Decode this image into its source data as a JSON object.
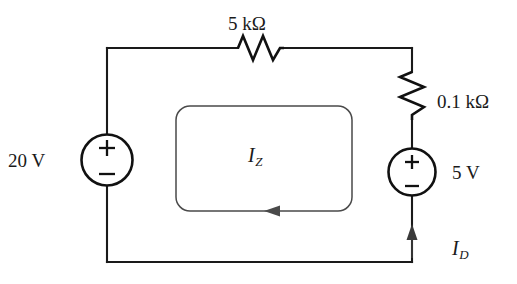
{
  "figure": {
    "kind": "circuit-schematic",
    "background_color": "#ffffff",
    "ink_color": "#1a1a1a",
    "loop_color": "#4a4a4a"
  },
  "components": {
    "resistor_top": {
      "label": "5 kΩ",
      "value": "5",
      "unit": "kΩ",
      "orientation": "horizontal",
      "position": "top-branch"
    },
    "resistor_right": {
      "label": "0.1 kΩ",
      "value": "0.1",
      "unit": "kΩ",
      "orientation": "vertical",
      "position": "right-branch"
    },
    "source_left": {
      "label": "20 V",
      "value": "20",
      "unit": "V",
      "type": "independent-voltage-source",
      "plus_terminal": "top",
      "minus_terminal": "bottom",
      "plus_sign": "+",
      "minus_sign": "−"
    },
    "source_right": {
      "label": "5 V",
      "value": "5",
      "unit": "V",
      "type": "independent-voltage-source",
      "plus_terminal": "top",
      "minus_terminal": "bottom",
      "plus_sign": "+",
      "minus_sign": "−"
    }
  },
  "currents": {
    "mesh": {
      "symbol": "I",
      "subscript": "Z",
      "label": "I_Z",
      "direction": "counterclockwise",
      "arrow_position": "bottom-of-loop",
      "arrow_points": "left"
    },
    "branch": {
      "symbol": "I",
      "subscript": "D",
      "label": "I_D",
      "direction": "upward",
      "arrow_position": "right-branch-below-source",
      "arrow_points": "up"
    }
  }
}
